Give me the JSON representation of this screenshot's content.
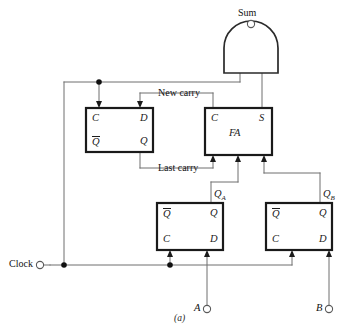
{
  "figure": {
    "caption": "(a)",
    "title_label": "Sum"
  },
  "colors": {
    "wire": "#6f6f6f",
    "box_outline": "#1a1a1a",
    "text": "#1b1b1b",
    "background": "#ffffff"
  },
  "io_ports": [
    {
      "name": "sum-port",
      "label": "Sum"
    },
    {
      "name": "clock-port",
      "label": "Clock"
    },
    {
      "name": "a-input-port",
      "label": "A"
    },
    {
      "name": "b-input-port",
      "label": "B"
    }
  ],
  "blocks": {
    "carry_flipflop": {
      "title": "",
      "pins": {
        "c": "C",
        "d": "D",
        "qbar": "Q",
        "q": "Q"
      }
    },
    "full_adder": {
      "title": "FA",
      "pins": {
        "c": "C",
        "s": "S"
      }
    },
    "flipflop_a": {
      "pins": {
        "qbar": "Q",
        "q": "Q",
        "c": "C",
        "d": "D"
      }
    },
    "flipflop_b": {
      "pins": {
        "qbar": "Q",
        "q": "Q",
        "c": "C",
        "d": "D"
      }
    }
  },
  "wire_labels": {
    "new_carry": "New carry",
    "last_carry": "Last carry",
    "q_a": "Q",
    "q_a_sub": "A",
    "q_b": "Q",
    "q_b_sub": "B"
  }
}
